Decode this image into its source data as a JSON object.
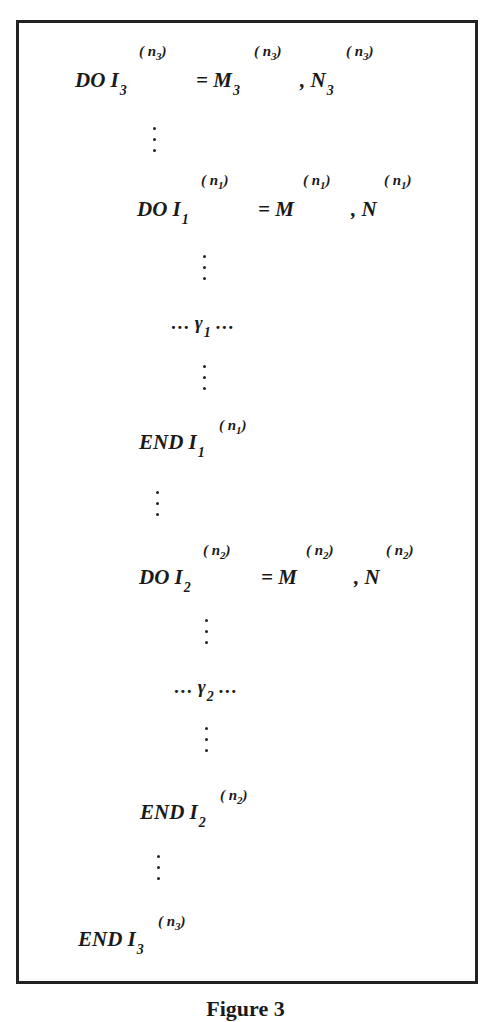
{
  "figure": {
    "caption": "Figure 3",
    "lines": {
      "l1": {
        "kw": "DO",
        "var": "I",
        "var_sub": "3",
        "sup": "( n",
        "sup_sub": "3",
        "sup_close": ")",
        "eq": "= M",
        "eq_sub": "3",
        "eq_sup": "( n",
        "eq_sup_sub": "3",
        "eq_sup_close": ")",
        "comma": ", N",
        "comma_sub": "3",
        "comma_sup": "( n",
        "comma_sup_sub": "3",
        "comma_sup_close": ")"
      },
      "l2": {
        "kw": "DO",
        "var": "I",
        "var_sub": "1",
        "sup": "( n",
        "sup_sub": "1",
        "sup_close": ")",
        "eq": "= M",
        "eq_sup": "( n",
        "eq_sup_sub": "1",
        "eq_sup_close": ")",
        "comma": ", N",
        "comma_sup": "( n",
        "comma_sup_sub": "1",
        "comma_sup_close": ")"
      },
      "g1": {
        "pre": "… γ",
        "sub": "1",
        "post": " …"
      },
      "e1": {
        "kw": "END",
        "var": "I",
        "var_sub": "1",
        "sup": "( n",
        "sup_sub": "1",
        "sup_close": ")"
      },
      "l3": {
        "kw": "DO",
        "var": "I",
        "var_sub": "2",
        "sup": "( n",
        "sup_sub": "2",
        "sup_close": ")",
        "eq": "= M",
        "eq_sup": "( n",
        "eq_sup_sub": "2",
        "eq_sup_close": ")",
        "comma": ", N",
        "comma_sup": "( n",
        "comma_sup_sub": "2",
        "comma_sup_close": ")"
      },
      "g2": {
        "pre": "… γ",
        "sub": "2",
        "post": " …"
      },
      "e2": {
        "kw": "END",
        "var": "I",
        "var_sub": "2",
        "sup": "( n",
        "sup_sub": "2",
        "sup_close": ")"
      },
      "e3": {
        "kw": "END",
        "var": "I",
        "var_sub": "3",
        "sup": "( n",
        "sup_sub": "3",
        "sup_close": ")"
      }
    },
    "vertical_ellipsis_icon": "vertical-dots"
  }
}
